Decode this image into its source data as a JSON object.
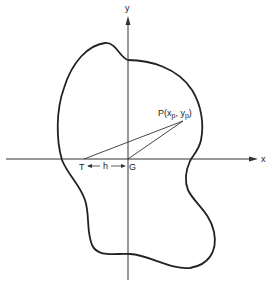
{
  "labels": {
    "y_axis": "y",
    "x_axis": "x",
    "point_p": "P(x",
    "point_p_sub_x": "p",
    "point_p_mid": ", y",
    "point_p_sub_y": "p",
    "point_p_close": ")",
    "point_t": "T",
    "point_g": "G",
    "distance_h": "h"
  },
  "colors": {
    "stroke": "#222222",
    "background": "#ffffff"
  }
}
